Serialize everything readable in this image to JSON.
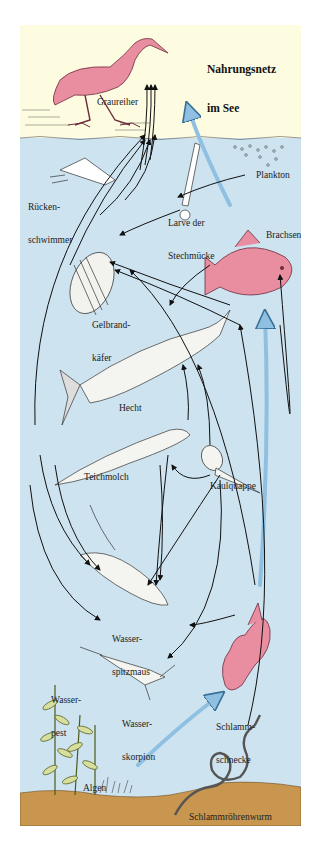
{
  "title": {
    "line1": "Nahrungsnetz",
    "line2": "im See"
  },
  "colors": {
    "sky": "#fdfbe0",
    "water": "#cde3ef",
    "sediment": "#c9964f",
    "prey_highlight": "#e98da1",
    "energy_arrow": "#8fc0e2",
    "feeding_arrow": "#111111",
    "plant": "#d8df9c"
  },
  "organisms": [
    {
      "id": "graureiher",
      "label": "Graureiher"
    },
    {
      "id": "rueckenschwimmer",
      "label_line1": "Rücken-",
      "label_line2": "schwimmer"
    },
    {
      "id": "stechmueckenlarve",
      "label_line1": "Larve der",
      "label_line2": "Stechmücke"
    },
    {
      "id": "plankton",
      "label": "Plankton"
    },
    {
      "id": "brachsen",
      "label": "Brachsen"
    },
    {
      "id": "gelbrandkaefer",
      "label_line1": "Gelbrand-",
      "label_line2": "käfer"
    },
    {
      "id": "hecht",
      "label": "Hecht"
    },
    {
      "id": "teichmolch",
      "label": "Teichmolch"
    },
    {
      "id": "kaulquappe",
      "label": "Kaulquappe"
    },
    {
      "id": "wasserspitzmaus",
      "label_line1": "Wasser-",
      "label_line2": "spitzmaus"
    },
    {
      "id": "wasserpest",
      "label_line1": "Wasser-",
      "label_line2": "pest"
    },
    {
      "id": "wasserskorpion",
      "label_line1": "Wasser-",
      "label_line2": "skorpion"
    },
    {
      "id": "schlammschnecke",
      "label_line1": "Schlamm-",
      "label_line2": "schnecke"
    },
    {
      "id": "algen",
      "label": "Algen"
    },
    {
      "id": "schlammroehrenwurm",
      "label": "Schlammröhrenwurm"
    }
  ],
  "legend": {
    "black_arrow": "wird gefressen von",
    "blue_arrow": "Haupt-Nahrungskette"
  }
}
